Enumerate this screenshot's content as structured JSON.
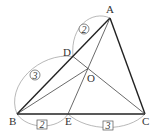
{
  "figure": {
    "type": "triangle-geometry",
    "points": {
      "A": {
        "label": "A",
        "x": 110,
        "y": 18
      },
      "B": {
        "label": "B",
        "x": 17,
        "y": 114
      },
      "C": {
        "label": "C",
        "x": 145,
        "y": 114
      },
      "D": {
        "label": "D",
        "x": 73,
        "y": 56.5
      },
      "E": {
        "label": "E",
        "x": 68,
        "y": 114
      },
      "O": {
        "label": "O",
        "x": 88,
        "y": 68.5
      }
    },
    "ratios": {
      "AD": {
        "value": "2",
        "style": "circled"
      },
      "DB": {
        "value": "3",
        "style": "circled"
      },
      "BE": {
        "value": "2",
        "style": "boxed"
      },
      "EC": {
        "value": "3",
        "style": "boxed"
      }
    },
    "segments": [
      "AB",
      "BC",
      "CA",
      "AE",
      "CD",
      "BO"
    ],
    "colors": {
      "line": "#333333",
      "arc": "#999999"
    }
  }
}
